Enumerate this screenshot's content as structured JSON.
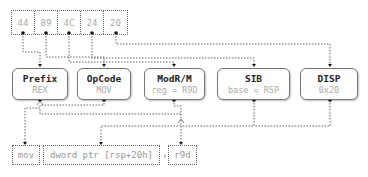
{
  "bytes": [
    "44",
    "89",
    "4C",
    "24",
    "20"
  ],
  "fields": [
    {
      "name": "Prefix",
      "value": "REX"
    },
    {
      "name": "OpCode",
      "value": "MOV"
    },
    {
      "name": "ModR/M",
      "value": "reg = R9D"
    },
    {
      "name": "SIB",
      "value": "base = RSP"
    },
    {
      "name": "DISP",
      "value": "0x20"
    }
  ],
  "assembly": {
    "mnemonic": "mov",
    "operand1": "dword ptr [rsp+20h]",
    "separator": ",",
    "operand2": "r9d"
  },
  "colors": {
    "line": "#666666",
    "dot": "#111111",
    "text_dim": "#aaaaaa"
  }
}
